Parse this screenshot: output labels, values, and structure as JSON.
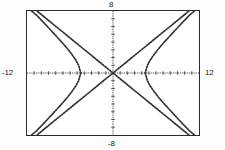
{
  "screen": {
    "name": "graphing-calculator-viewport",
    "background_color": "#fdfdfd",
    "frame_color": "#2b2b2b",
    "curve_color": "#333333"
  },
  "window_labels": {
    "xmin": "-12",
    "xmax": "12",
    "ymax": "8",
    "ymin": "-8"
  },
  "chart_data": {
    "type": "line",
    "title": "",
    "subtitle": "",
    "xlabel": "",
    "ylabel": "",
    "xlim": [
      -12,
      12
    ],
    "ylim": [
      -8,
      8
    ],
    "grid": false,
    "legend_position": "none",
    "axes": {
      "x_axis_visible": true,
      "y_axis_visible": true,
      "x_tick_spacing": 1,
      "y_tick_spacing": 1,
      "x_ticks": [
        -11,
        -10,
        -9,
        -8,
        -7,
        -6,
        -5,
        -4,
        -3,
        -2,
        -1,
        1,
        2,
        3,
        4,
        5,
        6,
        7,
        8,
        9,
        10,
        11
      ],
      "y_ticks": [
        -7,
        -6,
        -5,
        -4,
        -3,
        -2,
        -1,
        1,
        2,
        3,
        4,
        5,
        6,
        7
      ]
    },
    "annotations": [
      {
        "text": "-12",
        "position": "left-of-frame-at-x-axis"
      },
      {
        "text": "12",
        "position": "right-of-frame-at-x-axis"
      },
      {
        "text": "8",
        "position": "above-frame-at-y-axis"
      },
      {
        "text": "-8",
        "position": "below-frame-at-y-axis"
      }
    ],
    "series": [
      {
        "name": "hyperbola-right-branch",
        "style": "dotted",
        "equation_form": "x^2/a^2 - y^2/b^2 = 1",
        "a": 4.5,
        "b": 3.4,
        "x": [
          4.5,
          4.8,
          5.2,
          5.7,
          6.3,
          7.0,
          7.8,
          8.7,
          9.6,
          10.6,
          11.6,
          12.0
        ],
        "y": [
          0.0,
          1.0,
          1.68,
          2.35,
          3.08,
          3.83,
          4.64,
          5.54,
          6.44,
          7.4,
          8.2,
          8.6
        ]
      },
      {
        "name": "hyperbola-right-branch-lower",
        "style": "dotted",
        "x": [
          4.5,
          4.8,
          5.2,
          5.7,
          6.3,
          7.0,
          7.8,
          8.7,
          9.6,
          10.6,
          11.6,
          12.0
        ],
        "y": [
          0.0,
          -1.0,
          -1.68,
          -2.35,
          -3.08,
          -3.83,
          -4.64,
          -5.54,
          -6.44,
          -7.4,
          -8.2,
          -8.6
        ]
      },
      {
        "name": "hyperbola-left-branch",
        "style": "dotted",
        "x": [
          -4.5,
          -4.8,
          -5.2,
          -5.7,
          -6.3,
          -7.0,
          -7.8,
          -8.7,
          -9.6,
          -10.6,
          -11.6,
          -12.0
        ],
        "y": [
          0.0,
          1.0,
          1.68,
          2.35,
          3.08,
          3.83,
          4.64,
          5.54,
          6.44,
          7.4,
          8.2,
          8.6
        ]
      },
      {
        "name": "hyperbola-left-branch-lower",
        "style": "dotted",
        "x": [
          -4.5,
          -4.8,
          -5.2,
          -5.7,
          -6.3,
          -7.0,
          -7.8,
          -8.7,
          -9.6,
          -10.6,
          -11.6,
          -12.0
        ],
        "y": [
          0.0,
          -1.0,
          -1.68,
          -2.35,
          -3.08,
          -3.83,
          -4.64,
          -5.54,
          -6.44,
          -7.4,
          -8.2,
          -8.6
        ]
      },
      {
        "name": "asymptote-positive-slope",
        "style": "dotted",
        "slope": 0.7556,
        "intercept": 0,
        "x": [
          -11.4,
          11.4
        ],
        "y": [
          -8.6,
          8.6
        ]
      },
      {
        "name": "asymptote-negative-slope",
        "style": "dotted",
        "slope": -0.7556,
        "intercept": 0,
        "x": [
          -11.4,
          11.4
        ],
        "y": [
          8.6,
          -8.6
        ]
      }
    ]
  }
}
